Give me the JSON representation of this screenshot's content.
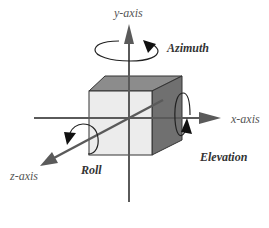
{
  "diagram": {
    "axes": [
      {
        "id": "y",
        "label": "y-axis"
      },
      {
        "id": "x",
        "label": "x-axis"
      },
      {
        "id": "z",
        "label": "z-axis"
      }
    ],
    "rotations": [
      {
        "id": "azimuth",
        "label": "Azimuth",
        "about": "y-axis"
      },
      {
        "id": "elevation",
        "label": "Elevation",
        "about": "x-axis"
      },
      {
        "id": "roll",
        "label": "Roll",
        "about": "z-axis"
      }
    ],
    "colors": {
      "axis": "#5a5a5a",
      "cube_front": "#ececec",
      "cube_top": "#8a8a8a",
      "cube_side": "#6e6e6e",
      "edge": "#333333"
    }
  }
}
